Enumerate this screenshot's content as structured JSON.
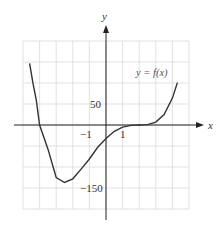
{
  "chart_data": {
    "type": "line",
    "title": "",
    "xlabel": "x",
    "ylabel": "y",
    "function_label": "y = f(x)",
    "xlim": [
      -5,
      5
    ],
    "ylim": [
      -200,
      200
    ],
    "x_tick_labels": [
      {
        "value": -1,
        "label": "−1"
      },
      {
        "value": 1,
        "label": "1"
      }
    ],
    "y_tick_labels": [
      {
        "value": 50,
        "label": "50"
      },
      {
        "value": -150,
        "label": "−150"
      }
    ],
    "grid": true,
    "grid_step_x": 1,
    "grid_step_y": 50,
    "series": [
      {
        "name": "f(x)",
        "x": [
          -4.6,
          -4.4,
          -4.2,
          -4.0,
          -3.5,
          -3.0,
          -2.5,
          -2.0,
          -1.5,
          -1.0,
          -0.5,
          0,
          0.5,
          1.0,
          1.5,
          2.0,
          2.5,
          3.0,
          3.5,
          4.0,
          4.3
        ],
        "values": [
          147,
          99,
          59,
          0,
          -57,
          -125,
          -137,
          -128,
          -105,
          -81,
          -53,
          -32,
          -15,
          -5,
          -1,
          0,
          1,
          7,
          25,
          64,
          101
        ]
      }
    ],
    "annotations": {
      "x_intercepts": [
        -4,
        2
      ],
      "y_intercept": -32,
      "local_min": {
        "x": -2.5,
        "y": -137
      }
    }
  },
  "labels": {
    "x_axis": "x",
    "y_axis": "y",
    "function": "y = f(x)",
    "tick_50": "50",
    "tick_neg150": "−150",
    "tick_neg1": "−1",
    "tick_1": "1"
  }
}
